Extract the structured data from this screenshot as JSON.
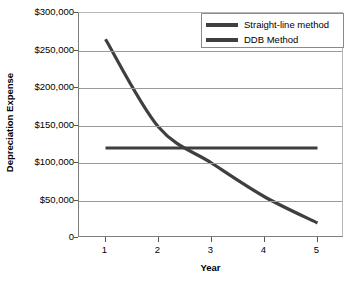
{
  "chart_data": {
    "type": "line",
    "title": "",
    "xlabel": "Year",
    "ylabel": "Depreciation Expense",
    "x": [
      1,
      2,
      3,
      4,
      5
    ],
    "xlim": [
      0.5,
      5.5
    ],
    "ylim": [
      0,
      300000
    ],
    "grid": true,
    "legend_position": "top-right-inside",
    "x_tick_labels": [
      "1",
      "2",
      "3",
      "4",
      "5"
    ],
    "y_tick_labels": [
      "$300,000",
      "$250,000",
      "$200,000",
      "$150,000",
      "$100,000",
      "$50,000",
      "0"
    ],
    "y_tick_values": [
      300000,
      250000,
      200000,
      150000,
      100000,
      50000,
      0
    ],
    "series": [
      {
        "name": "Straight-line method",
        "color": "#3f3f3f",
        "values": [
          120000,
          120000,
          120000,
          120000,
          120000
        ]
      },
      {
        "name": "DDB Method",
        "color": "#3f3f3f",
        "values": [
          265000,
          148000,
          100000,
          55000,
          20000
        ]
      }
    ]
  },
  "legend": {
    "items": [
      {
        "label": "Straight-line method"
      },
      {
        "label": "DDB Method"
      }
    ]
  },
  "axes": {
    "y_title": "Depreciation Expense",
    "x_title": "Year"
  },
  "colors": {
    "series_line": "#3f3f3f",
    "gridline": "#9a9a9a",
    "axis": "#555555",
    "background": "#ffffff",
    "text": "#000000"
  }
}
